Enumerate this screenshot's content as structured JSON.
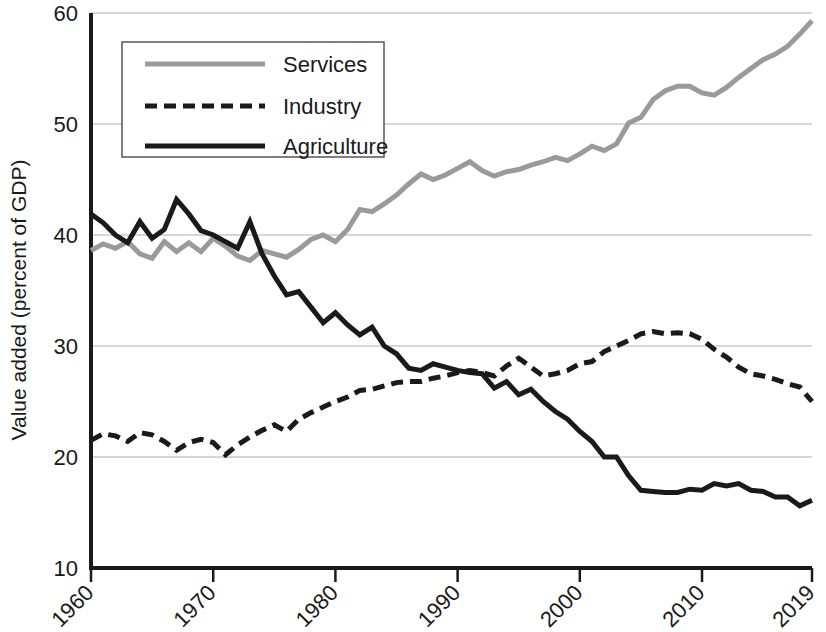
{
  "chart_data": {
    "type": "line",
    "title": "",
    "xlabel": "",
    "ylabel": "Value added (percent of GDP)",
    "xlim": [
      1960,
      2019
    ],
    "ylim": [
      10,
      60
    ],
    "grid": true,
    "grid_axis": "y",
    "legend_position": "top-left-inside",
    "xticks": [
      1960,
      1970,
      1980,
      1990,
      2000,
      2010,
      2019
    ],
    "xtick_labels": [
      "1960",
      "1970",
      "1980",
      "1990",
      "2000",
      "2010",
      "2019"
    ],
    "xtick_rotation": 45,
    "yticks": [
      10,
      20,
      30,
      40,
      50,
      60
    ],
    "ytick_labels": [
      "10",
      "20",
      "30",
      "40",
      "50",
      "60"
    ],
    "x": [
      1960,
      1961,
      1962,
      1963,
      1964,
      1965,
      1966,
      1967,
      1968,
      1969,
      1970,
      1971,
      1972,
      1973,
      1974,
      1975,
      1976,
      1977,
      1978,
      1979,
      1980,
      1981,
      1982,
      1983,
      1984,
      1985,
      1986,
      1987,
      1988,
      1989,
      1990,
      1991,
      1992,
      1993,
      1994,
      1995,
      1996,
      1997,
      1998,
      1999,
      2000,
      2001,
      2002,
      2003,
      2004,
      2005,
      2006,
      2007,
      2008,
      2009,
      2010,
      2011,
      2012,
      2013,
      2014,
      2015,
      2016,
      2017,
      2018,
      2019
    ],
    "series": [
      {
        "name": "Services",
        "color": "#9a9a9a",
        "style": "solid",
        "values": [
          38.6,
          39.2,
          38.8,
          39.4,
          38.3,
          37.9,
          39.4,
          38.5,
          39.3,
          38.5,
          39.7,
          39.0,
          38.1,
          37.7,
          38.6,
          38.3,
          38.0,
          38.7,
          39.6,
          40.0,
          39.4,
          40.5,
          42.3,
          42.1,
          42.8,
          43.6,
          44.6,
          45.5,
          45.0,
          45.4,
          46.0,
          46.6,
          45.8,
          45.3,
          45.7,
          45.9,
          46.3,
          46.6,
          47.0,
          46.7,
          47.3,
          48.0,
          47.6,
          48.2,
          50.1,
          50.6,
          52.2,
          53.0,
          53.4,
          53.4,
          52.8,
          52.6,
          53.3,
          54.2,
          55.0,
          55.8,
          56.3,
          57.0,
          58.1,
          59.3
        ]
      },
      {
        "name": "Industry",
        "color": "#1a1a1a",
        "style": "dashed",
        "values": [
          21.5,
          22.1,
          21.9,
          21.4,
          22.2,
          22.0,
          21.4,
          20.6,
          21.3,
          21.6,
          21.3,
          20.2,
          21.1,
          21.8,
          22.4,
          22.9,
          22.3,
          23.4,
          24.0,
          24.5,
          25.0,
          25.4,
          26.0,
          26.1,
          26.4,
          26.7,
          26.8,
          26.8,
          27.1,
          27.3,
          27.6,
          27.8,
          27.6,
          27.3,
          28.2,
          28.9,
          28.1,
          27.3,
          27.5,
          27.8,
          28.4,
          28.6,
          29.5,
          30.0,
          30.5,
          31.1,
          31.3,
          31.1,
          31.2,
          31.1,
          30.6,
          29.7,
          29.0,
          28.1,
          27.5,
          27.3,
          27.0,
          26.6,
          26.3,
          25.0
        ]
      },
      {
        "name": "Agriculture",
        "color": "#1a1a1a",
        "style": "solid",
        "values": [
          41.9,
          41.1,
          40.0,
          39.3,
          41.2,
          39.7,
          40.5,
          43.2,
          41.9,
          40.4,
          40.0,
          39.4,
          38.8,
          41.2,
          38.3,
          36.3,
          34.6,
          34.9,
          33.5,
          32.1,
          33.0,
          31.9,
          31.0,
          31.7,
          30.0,
          29.3,
          28.0,
          27.8,
          28.4,
          28.1,
          27.8,
          27.6,
          27.5,
          26.2,
          26.8,
          25.6,
          26.1,
          25.0,
          24.1,
          23.4,
          22.3,
          21.4,
          20.0,
          20.0,
          18.3,
          17.0,
          16.9,
          16.8,
          16.8,
          17.1,
          17.0,
          17.6,
          17.4,
          17.6,
          17.0,
          16.9,
          16.4,
          16.4,
          15.6,
          16.1
        ]
      }
    ]
  },
  "legend": {
    "items": [
      {
        "label": "Services",
        "swatch": "services-swatch"
      },
      {
        "label": "Industry",
        "swatch": "industry-swatch"
      },
      {
        "label": "Agriculture",
        "swatch": "agriculture-swatch"
      }
    ]
  },
  "axes": {
    "y_axis_title": "Value added (percent of GDP)"
  }
}
